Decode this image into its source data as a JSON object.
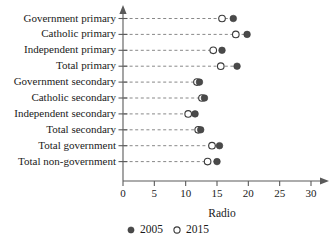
{
  "chart_data": {
    "type": "scatter",
    "title": "",
    "xlabel": "Radio",
    "ylabel": "",
    "xlim": [
      0,
      30
    ],
    "xticks": [
      0,
      5,
      10,
      15,
      20,
      25,
      30
    ],
    "xtick_labels": [
      "0",
      "5",
      "10",
      "15",
      "20",
      "25",
      "30"
    ],
    "grid": false,
    "guide_lines": "dashed horizontal from axis to markers",
    "legend_position": "bottom-center",
    "categories": [
      "Government primary",
      "Catholic primary",
      "Independent primary",
      "Total primary",
      "Government secondary",
      "Catholic secondary",
      "Independent secondary",
      "Total secondary",
      "Total government",
      "Total non-government"
    ],
    "series": [
      {
        "name": "2005",
        "marker": "filled-circle",
        "color": "#4a4a4a",
        "values": [
          17.6,
          19.8,
          15.8,
          18.2,
          12.2,
          13.0,
          11.5,
          12.4,
          15.4,
          15.0
        ]
      },
      {
        "name": "2015",
        "marker": "open-circle",
        "color": "#ffffff",
        "values": [
          15.8,
          18.0,
          14.4,
          15.6,
          11.8,
          12.6,
          10.4,
          12.0,
          14.2,
          13.5
        ]
      }
    ]
  },
  "legend": {
    "entries": [
      {
        "label": "2005",
        "marker": "filled-circle"
      },
      {
        "label": "2015",
        "marker": "open-circle"
      }
    ]
  },
  "axis": {
    "x_axis_title": "Radio"
  }
}
